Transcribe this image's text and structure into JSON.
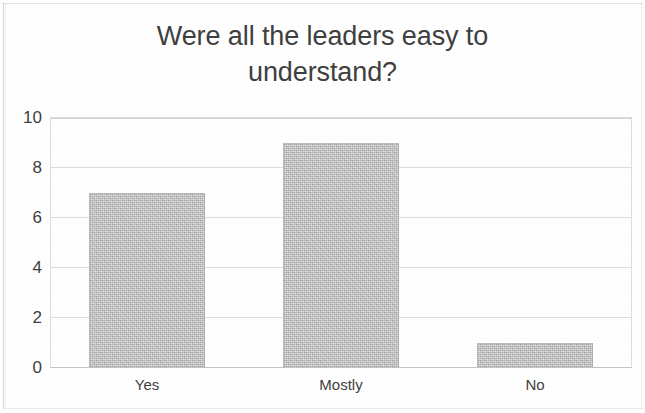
{
  "chart_data": {
    "type": "bar",
    "title": "Were all the leaders easy to\nunderstand?",
    "title_line1": "Were all the leaders easy to",
    "title_line2": "understand?",
    "categories": [
      "Yes",
      "Mostly",
      "No"
    ],
    "values": [
      7,
      9,
      1
    ],
    "series": [
      {
        "name": "Responses",
        "values": [
          7,
          9,
          1
        ]
      }
    ],
    "xlabel": "",
    "ylabel": "",
    "ylim": [
      0,
      10
    ],
    "y_ticks": [
      0,
      2,
      4,
      6,
      8,
      10
    ],
    "y_tick_labels": [
      "0",
      "2",
      "4",
      "6",
      "8",
      "10"
    ],
    "grid": true,
    "legend": false,
    "bar_color": "#b9b9b9",
    "title_color": "#3f3f3f",
    "gridline_color": "#dcdcdc",
    "axis_color": "#c4c4c4",
    "background_color": "#ffffff"
  }
}
